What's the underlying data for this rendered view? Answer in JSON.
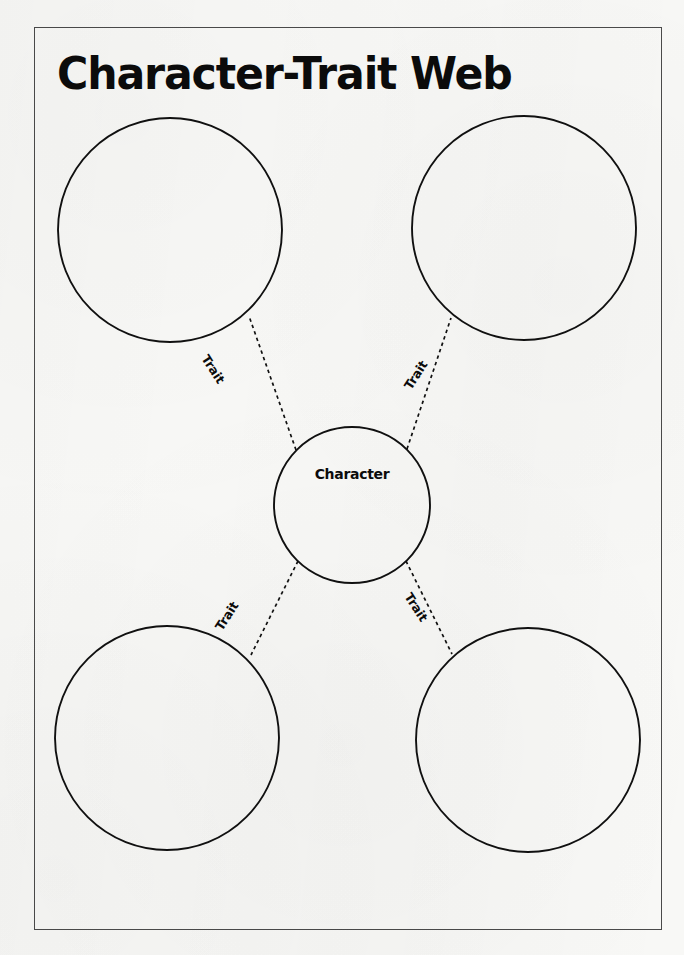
{
  "page": {
    "title": "Character-Trait Web",
    "page_number": "",
    "border_color": "#4a4a4a",
    "ink_color": "#0b0b0b",
    "paper_color": "#f8f8f6"
  },
  "diagram": {
    "type": "web-organizer",
    "center": {
      "label": "Character",
      "cx": 352,
      "cy": 505,
      "r": 78
    },
    "nodes": [
      {
        "id": "top-left",
        "label": "",
        "cx": 170,
        "cy": 230,
        "r": 112
      },
      {
        "id": "top-right",
        "label": "",
        "cx": 524,
        "cy": 228,
        "r": 112
      },
      {
        "id": "bottom-left",
        "label": "",
        "cx": 167,
        "cy": 738,
        "r": 112
      },
      {
        "id": "bottom-right",
        "label": "",
        "cx": 528,
        "cy": 740,
        "r": 112
      }
    ],
    "connectors": [
      {
        "id": "connector-top-left",
        "label": "Trait",
        "from": "center",
        "to": "top-left",
        "style": "dashed",
        "label_x": 211,
        "label_y": 352,
        "label_rotation": 57
      },
      {
        "id": "connector-top-right",
        "label": "Trait",
        "from": "center",
        "to": "top-right",
        "style": "dashed",
        "label_x": 401,
        "label_y": 352,
        "label_rotation": -57
      },
      {
        "id": "connector-bottom-left",
        "label": "Trait",
        "from": "center",
        "to": "bottom-left",
        "style": "dashed",
        "label_x": 212,
        "label_y": 593,
        "label_rotation": -57
      },
      {
        "id": "connector-bottom-right",
        "label": "Trait",
        "from": "center",
        "to": "bottom-right",
        "style": "dashed",
        "label_x": 414,
        "label_y": 590,
        "label_rotation": 57
      }
    ]
  }
}
